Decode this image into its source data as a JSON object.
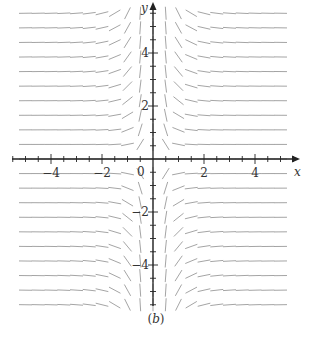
{
  "figure": {
    "caption_open": "(",
    "caption_letter": "b",
    "caption_close": ")",
    "x_axis_label": "x",
    "y_axis_label": "y",
    "origin_label": "0",
    "x_tick_labels": [
      {
        "value": -4,
        "text": "−4"
      },
      {
        "value": -2,
        "text": "−2"
      },
      {
        "value": 2,
        "text": "2"
      },
      {
        "value": 4,
        "text": "4"
      }
    ],
    "y_tick_labels": [
      {
        "value": 4,
        "text": "4"
      },
      {
        "value": 2,
        "text": "2"
      },
      {
        "value": -2,
        "text": "−2"
      },
      {
        "value": -4,
        "text": "−4"
      }
    ],
    "colors": {
      "axis": "#222222",
      "field": "#9a9a9a",
      "text": "#333333"
    }
  },
  "chart_data": {
    "type": "slope_field",
    "title": "",
    "caption": "(b)",
    "xlabel": "x",
    "ylabel": "y",
    "xlim": [
      -5.8,
      5.8
    ],
    "ylim": [
      -5.8,
      5.8
    ],
    "x_ticks_major": [
      -4,
      -2,
      2,
      4
    ],
    "y_ticks_major": [
      -4,
      -2,
      2,
      4
    ],
    "minor_tick_step": 0.5,
    "grid": false,
    "field_x_range": [
      -5,
      5
    ],
    "field_y_range": [
      -5.5,
      5.5
    ],
    "field_x_step": 0.5,
    "field_y_step": 0.55,
    "slope_pattern": "slope sign = -sign(x)·sign(y); near-horizontal for |x|>2, steep/vertical for |x|<1",
    "sample_slopes": [
      {
        "region": "upper-left (x<0,y>0)",
        "sign": "positive"
      },
      {
        "region": "upper-right (x>0,y>0)",
        "sign": "negative"
      },
      {
        "region": "lower-left (x<0,y<0)",
        "sign": "negative"
      },
      {
        "region": "lower-right (x>0,y<0)",
        "sign": "positive"
      },
      {
        "region": "|x|<1",
        "sign": "near vertical"
      }
    ]
  },
  "layout": {
    "origin_px": [
      153,
      159
    ],
    "px_per_unit_x": 25.5,
    "px_per_unit_y": 26.5
  }
}
